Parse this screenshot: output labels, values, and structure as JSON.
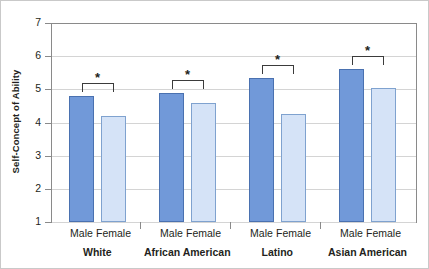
{
  "chart_data": {
    "type": "bar",
    "title": "",
    "xlabel": "",
    "ylabel": "Self-Concept of Ability",
    "ylim": [
      1,
      7
    ],
    "yticks": [
      "1",
      "2",
      "3",
      "4",
      "5",
      "6",
      "7"
    ],
    "grid": true,
    "legend": "none",
    "categories": [
      "White",
      "African American",
      "Latino",
      "Asian American"
    ],
    "subcategories": [
      "Male",
      "Female"
    ],
    "series": [
      {
        "name": "Male",
        "values": [
          4.8,
          4.9,
          5.35,
          5.6
        ]
      },
      {
        "name": "Female",
        "values": [
          4.2,
          4.6,
          4.25,
          5.05
        ]
      }
    ],
    "annotations": [
      {
        "group": "White",
        "marker": "*",
        "note": "significant difference"
      },
      {
        "group": "African American",
        "marker": "*",
        "note": "significant difference"
      },
      {
        "group": "Latino",
        "marker": "*",
        "note": "significant difference"
      },
      {
        "group": "Asian American",
        "marker": "*",
        "note": "significant difference"
      }
    ],
    "colors": {
      "male": "#7199D9",
      "female": "#D5E3F7",
      "male_edge": "#4A71B0",
      "female_edge": "#7FA2CF"
    }
  },
  "axis": {
    "y_title": "Self-Concept of Ability",
    "y_ticks": [
      "7",
      "6",
      "5",
      "4",
      "3",
      "2",
      "1"
    ]
  },
  "groups": [
    {
      "name": "White",
      "male_label": "Male",
      "female_label": "Female",
      "male": "4.8",
      "female": "4.2",
      "star": "*"
    },
    {
      "name": "African American",
      "male_label": "Male",
      "female_label": "Female",
      "male": "4.9",
      "female": "4.6",
      "star": "*"
    },
    {
      "name": "Latino",
      "male_label": "Male",
      "female_label": "Female",
      "male": "5.35",
      "female": "4.25",
      "star": "*"
    },
    {
      "name": "Asian American",
      "male_label": "Male",
      "female_label": "Female",
      "male": "5.6",
      "female": "5.05",
      "star": "*"
    }
  ]
}
